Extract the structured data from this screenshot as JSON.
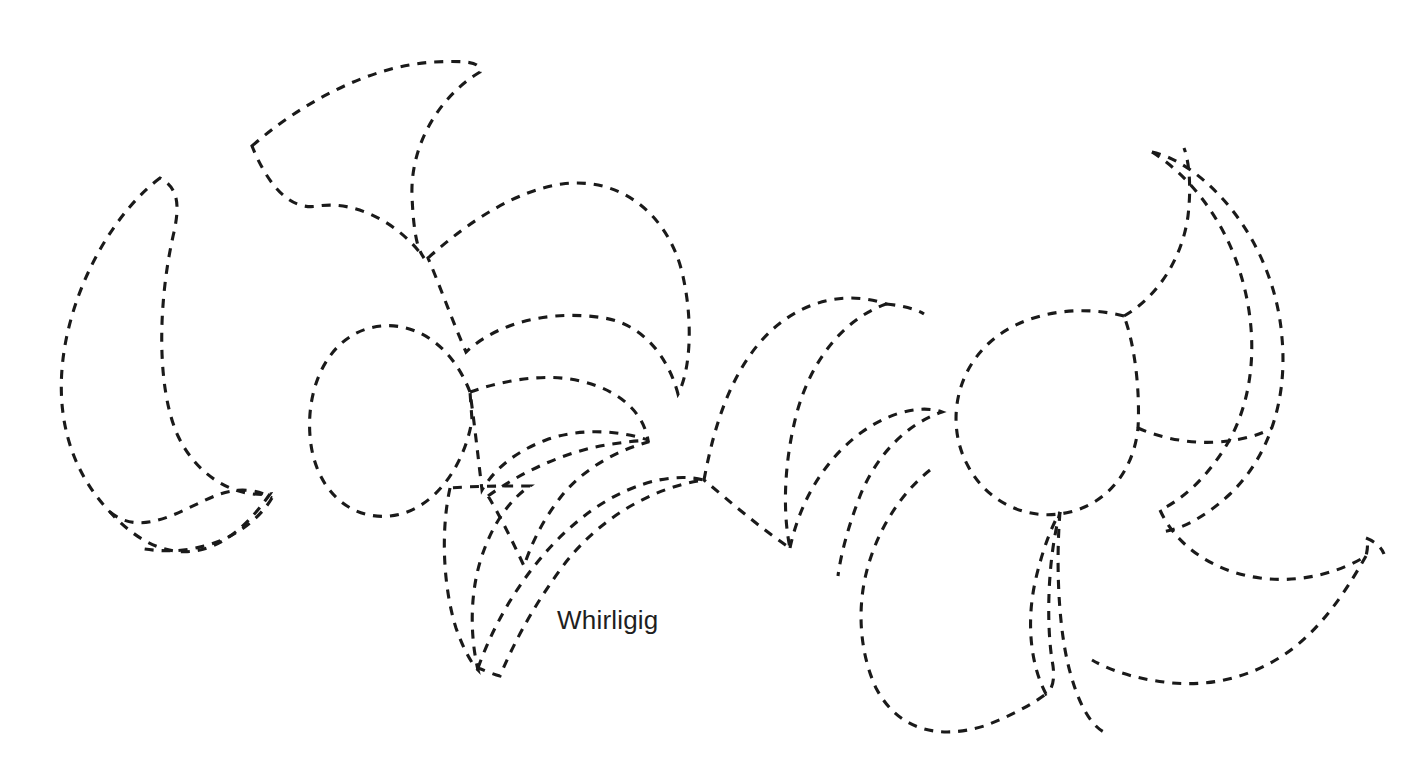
{
  "page": {
    "background_color": "#ffffff",
    "width": 1416,
    "height": 779
  },
  "artwork": {
    "title": "Whirligig",
    "style": {
      "stroke_color": "#1a1a1a",
      "stroke_width": 3.1,
      "dash_pattern": "9 8",
      "fill": "none"
    },
    "figures": [
      {
        "name": "left-pinwheel",
        "blade_count": 5,
        "center": [
          470,
          390
        ],
        "rotation_direction": "clockwise"
      },
      {
        "name": "right-pinwheel",
        "blade_count": 5,
        "center": [
          1110,
          440
        ],
        "rotation_direction": "clockwise"
      }
    ]
  },
  "caption": {
    "text": "Whirligig",
    "color": "#1f1f1f",
    "font_size_px": 26,
    "position": [
      557,
      604
    ]
  }
}
